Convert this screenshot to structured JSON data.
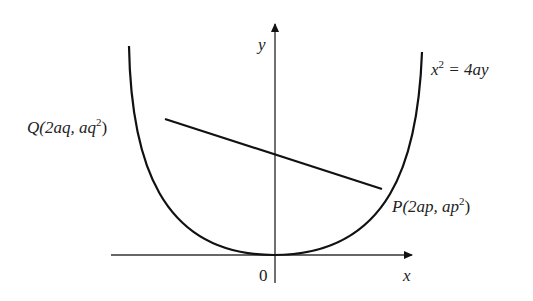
{
  "diagram": {
    "curve_equation": {
      "base": "x",
      "exp": "2",
      "rest": " = 4ay"
    },
    "axes": {
      "x_label": "x",
      "y_label": "y",
      "origin_label": "0"
    },
    "points": {
      "Q": {
        "name": "Q",
        "open": "(2aq, aq",
        "exp": "2",
        "close": ")"
      },
      "P": {
        "name": "P",
        "open": "(2ap, ap",
        "exp": "2",
        "close": ")"
      }
    },
    "colors": {
      "stroke": "#111111",
      "background": "#ffffff"
    }
  }
}
